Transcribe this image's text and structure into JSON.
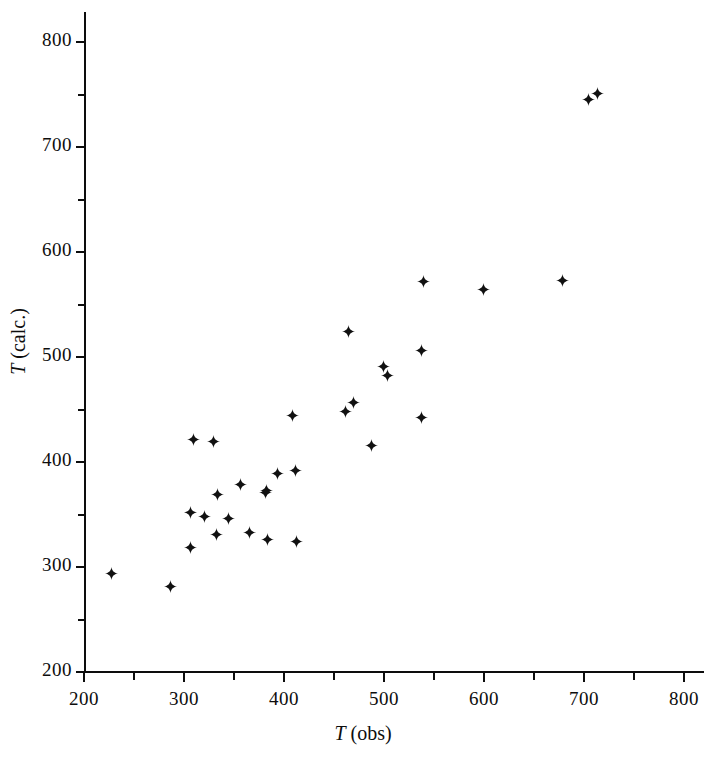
{
  "chart_data": {
    "type": "scatter",
    "title": "",
    "xlabel": "T (obs)",
    "ylabel": "T (calc.)",
    "xlabel_italic_prefix": "T",
    "xlabel_rest": " (obs)",
    "ylabel_italic_prefix": "T",
    "ylabel_rest": " (calc.)",
    "xlim": [
      200,
      830
    ],
    "ylim": [
      200,
      820
    ],
    "xticks": [
      200,
      300,
      400,
      500,
      600,
      700,
      800
    ],
    "yticks": [
      200,
      300,
      400,
      500,
      600,
      700,
      800
    ],
    "xtick_labels": [
      "200",
      "300",
      "400",
      "500",
      "600",
      "700",
      "800"
    ],
    "ytick_labels": [
      "200",
      "300",
      "400",
      "500",
      "600",
      "700",
      "800"
    ],
    "x_minor_ticks": [
      250,
      350,
      450,
      550,
      650,
      750
    ],
    "y_minor_ticks": [
      250,
      350,
      450,
      550,
      650,
      750
    ],
    "grid": false,
    "legend": null,
    "marker": "plus",
    "marker_color": "#111111",
    "points": [
      {
        "x": 227,
        "y": 294
      },
      {
        "x": 286,
        "y": 281
      },
      {
        "x": 306,
        "y": 352
      },
      {
        "x": 306,
        "y": 319
      },
      {
        "x": 309,
        "y": 421
      },
      {
        "x": 320,
        "y": 348
      },
      {
        "x": 329,
        "y": 420
      },
      {
        "x": 332,
        "y": 331
      },
      {
        "x": 333,
        "y": 369
      },
      {
        "x": 344,
        "y": 346
      },
      {
        "x": 356,
        "y": 379
      },
      {
        "x": 365,
        "y": 333
      },
      {
        "x": 381,
        "y": 371
      },
      {
        "x": 382,
        "y": 373
      },
      {
        "x": 383,
        "y": 326
      },
      {
        "x": 393,
        "y": 389
      },
      {
        "x": 408,
        "y": 444
      },
      {
        "x": 411,
        "y": 392
      },
      {
        "x": 412,
        "y": 324
      },
      {
        "x": 461,
        "y": 448
      },
      {
        "x": 464,
        "y": 524
      },
      {
        "x": 469,
        "y": 457
      },
      {
        "x": 487,
        "y": 416
      },
      {
        "x": 499,
        "y": 491
      },
      {
        "x": 503,
        "y": 482
      },
      {
        "x": 537,
        "y": 442
      },
      {
        "x": 537,
        "y": 506
      },
      {
        "x": 539,
        "y": 572
      },
      {
        "x": 599,
        "y": 564
      },
      {
        "x": 678,
        "y": 573
      },
      {
        "x": 704,
        "y": 745
      },
      {
        "x": 713,
        "y": 751
      }
    ]
  }
}
